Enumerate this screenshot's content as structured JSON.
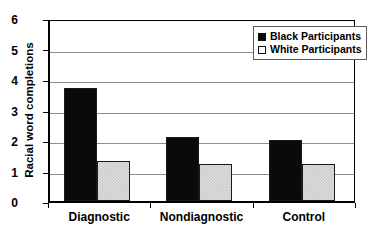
{
  "chart_data": {
    "type": "bar",
    "title": "",
    "subtitle": "",
    "xlabel": "",
    "ylabel": "Racial word completions",
    "categories": [
      "Diagnostic",
      "Nondiagnostic",
      "Control"
    ],
    "series": [
      {
        "name": "Black Participants",
        "values": [
          3.7,
          2.1,
          2.0
        ],
        "color": "#0a0a0a"
      },
      {
        "name": "White Participants",
        "values": [
          1.3,
          1.2,
          1.2
        ],
        "color": "#c9c9c9"
      }
    ],
    "ylim": [
      0,
      6
    ],
    "yticks": [
      0,
      1,
      2,
      3,
      4,
      5,
      6
    ],
    "ytick_labels": [
      "0",
      "1",
      "2",
      "3",
      "4",
      "5",
      "6"
    ],
    "grid": "horizontal",
    "legend_position": "top-right",
    "legend_entries": [
      {
        "label": "Black Participants",
        "swatch": "filled-black-square"
      },
      {
        "label": "White Participants",
        "swatch": "open-white-square"
      }
    ]
  }
}
